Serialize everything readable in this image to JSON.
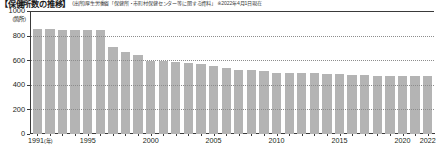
{
  "header": {
    "title": "【保健所数の推移】",
    "source": "(出所)厚生労働省「保健所・市町村保健センター等に関する資料」 ※2022年4月1日現在"
  },
  "chart_data": {
    "type": "bar",
    "title": "【保健所数の推移】",
    "xlabel": "年",
    "ylabel": "(箇所)",
    "ylim": [
      0,
      1000
    ],
    "yticks": [
      0,
      200,
      400,
      600,
      800,
      1000
    ],
    "ytick_labels": [
      "0",
      "200",
      "400",
      "600",
      "800",
      "1000"
    ],
    "grid": true,
    "grid_style": "dotted",
    "legend": "none",
    "bar_color": "#b4b4b4",
    "categories": [
      "1991",
      "1992",
      "1993",
      "1994",
      "1995",
      "1996",
      "1997",
      "1998",
      "1999",
      "2000",
      "2001",
      "2002",
      "2003",
      "2004",
      "2005",
      "2006",
      "2007",
      "2008",
      "2009",
      "2010",
      "2011",
      "2012",
      "2013",
      "2014",
      "2015",
      "2016",
      "2017",
      "2018",
      "2019",
      "2020",
      "2021",
      "2022"
    ],
    "values": [
      852,
      852,
      848,
      847,
      845,
      845,
      706,
      663,
      641,
      594,
      592,
      582,
      576,
      571,
      549,
      535,
      518,
      517,
      510,
      494,
      495,
      495,
      494,
      490,
      486,
      480,
      481,
      469,
      472,
      469,
      470,
      468
    ],
    "xtick_labels": [
      {
        "category": "1991",
        "text": "1991",
        "unit": "(年)"
      },
      {
        "category": "1995",
        "text": "1995",
        "unit": ""
      },
      {
        "category": "2000",
        "text": "2000",
        "unit": ""
      },
      {
        "category": "2005",
        "text": "2005",
        "unit": ""
      },
      {
        "category": "2010",
        "text": "2010",
        "unit": ""
      },
      {
        "category": "2015",
        "text": "2015",
        "unit": ""
      },
      {
        "category": "2020",
        "text": "2020",
        "unit": ""
      },
      {
        "category": "2022",
        "text": "2022",
        "unit": ""
      }
    ]
  }
}
